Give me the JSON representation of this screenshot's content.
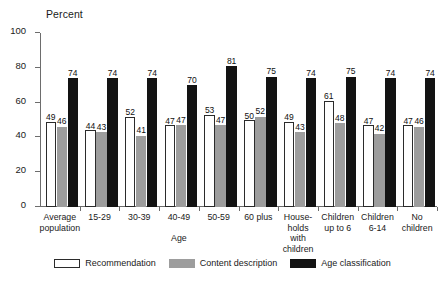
{
  "chart_data": {
    "type": "bar",
    "title": "",
    "subtitle": "",
    "xlabel": "Age",
    "ylabel": "Percent",
    "ylim": [
      0,
      100
    ],
    "yticks": [
      0,
      20,
      40,
      60,
      80,
      100
    ],
    "grid": false,
    "legend_position": "bottom",
    "categories": [
      "Average\npopulation",
      "15-29",
      "30-39",
      "40-49",
      "50-59",
      "60 plus",
      "House-\nholds\nwith\nchildren",
      "Children\nup to 6",
      "Children\n6-14",
      "No\nchildren"
    ],
    "series": [
      {
        "name": "Recommendation",
        "color": "#ffffff",
        "values": [
          49,
          44,
          52,
          47,
          53,
          50,
          49,
          61,
          47,
          47
        ]
      },
      {
        "name": "Content description",
        "color": "#9d9d9d",
        "values": [
          46,
          43,
          41,
          47,
          47,
          52,
          43,
          48,
          42,
          46
        ]
      },
      {
        "name": "Age classification",
        "color": "#131313",
        "values": [
          74,
          74,
          74,
          70,
          81,
          75,
          74,
          75,
          74,
          74
        ]
      }
    ]
  },
  "legend": {
    "items": [
      {
        "label": "Recommendation",
        "swatch": "rec"
      },
      {
        "label": "Content description",
        "swatch": "cd"
      },
      {
        "label": "Age classification",
        "swatch": "ac"
      }
    ]
  }
}
